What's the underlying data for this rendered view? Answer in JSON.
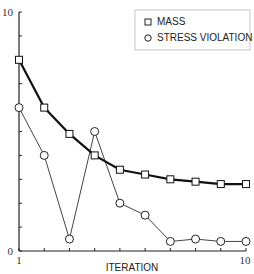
{
  "chart_data": {
    "type": "line",
    "title": "",
    "xlabel": "ITERATION",
    "ylabel": "",
    "x": [
      1,
      2,
      3,
      4,
      5,
      6,
      7,
      8,
      9,
      10
    ],
    "xlim": [
      1,
      10
    ],
    "ylim": [
      0,
      10
    ],
    "x_tick_labels": [
      "1",
      "10"
    ],
    "y_tick_labels": [
      "0",
      "10"
    ],
    "y_minor_ticks": [
      0,
      1,
      2,
      3,
      4,
      5,
      6,
      7,
      8,
      9,
      10
    ],
    "grid": false,
    "legend_position": "upper right",
    "series": [
      {
        "name": "MASS",
        "marker": "square",
        "line_weight": "thick",
        "values": [
          8.0,
          6.0,
          4.9,
          4.0,
          3.4,
          3.2,
          3.0,
          2.9,
          2.8,
          2.8
        ]
      },
      {
        "name": "STRESS VIOLATION",
        "marker": "circle",
        "line_weight": "thin",
        "values": [
          6.0,
          4.0,
          0.5,
          5.0,
          2.0,
          1.5,
          0.4,
          0.5,
          0.4,
          0.4
        ]
      }
    ]
  },
  "legend": {
    "items": [
      {
        "label": "MASS",
        "icon": "square-marker-icon"
      },
      {
        "label": "STRESS VIOLATION",
        "icon": "circle-marker-icon"
      }
    ]
  },
  "axes": {
    "x_title": "ITERATION",
    "x_min_label": "1",
    "x_max_label": "10",
    "y_min_label": "0",
    "y_max_label": "10"
  },
  "colors": {
    "axis": "#222222",
    "mass_line": "#111111",
    "stress_line": "#444444",
    "marker_fill": "#ffffff",
    "legend_border": "#bbbbbb"
  }
}
